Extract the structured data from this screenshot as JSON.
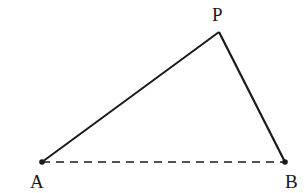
{
  "diagram": {
    "type": "triangle",
    "points": {
      "A": {
        "label": "A",
        "x": 42,
        "y": 162
      },
      "P": {
        "label": "P",
        "x": 219,
        "y": 32
      },
      "B": {
        "label": "B",
        "x": 285,
        "y": 162
      }
    },
    "edges": [
      {
        "from": "A",
        "to": "P",
        "style": "solid"
      },
      {
        "from": "P",
        "to": "B",
        "style": "solid"
      },
      {
        "from": "A",
        "to": "B",
        "style": "dashed"
      }
    ],
    "colors": {
      "stroke": "#1a1a1a",
      "background": "#ffffff"
    }
  }
}
